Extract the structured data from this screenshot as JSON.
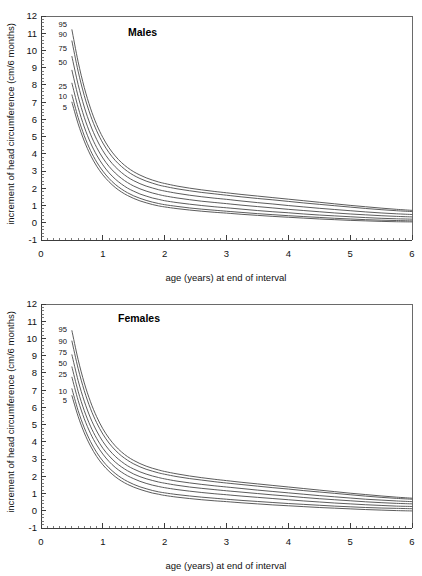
{
  "figure": {
    "background_color": "#ffffff",
    "curve_color": "#4a4a4a",
    "axis_color": "#3c3c3c"
  },
  "panels": [
    {
      "id": "males",
      "title": "Males"
    },
    {
      "id": "females",
      "title": "Females"
    }
  ],
  "axes": {
    "x_title": "age (years) at end of interval",
    "y_title": "increment of head circumference (cm/6 months)",
    "x_ticks": [
      "0",
      "1",
      "2",
      "3",
      "4",
      "5",
      "6"
    ],
    "y_ticks": [
      "-1",
      "0",
      "1",
      "2",
      "3",
      "4",
      "5",
      "6",
      "7",
      "8",
      "9",
      "10",
      "11",
      "12"
    ]
  },
  "percentile_labels": [
    "95",
    "90",
    "75",
    "50",
    "25",
    "10",
    "5"
  ],
  "chart_data": [
    {
      "type": "line",
      "title": "Males",
      "xlabel": "age (years) at end of interval",
      "ylabel": "increment of head circumference (cm/6 months)",
      "xlim": [
        0,
        6
      ],
      "ylim": [
        -1,
        12
      ],
      "xticks": [
        0,
        1,
        2,
        3,
        4,
        5,
        6
      ],
      "yticks": [
        -1,
        0,
        1,
        2,
        3,
        4,
        5,
        6,
        7,
        8,
        9,
        10,
        11,
        12
      ],
      "x_minor_tick_interval": 0.1,
      "y_minor_tick_interval": 0.2,
      "grid": false,
      "legend": "inline-labels-left",
      "x": [
        0.5,
        0.6,
        0.7,
        0.8,
        0.9,
        1.0,
        1.1,
        1.2,
        1.3,
        1.4,
        1.5,
        1.6,
        1.7,
        1.8,
        1.9,
        2.0,
        2.2,
        2.4,
        2.6,
        2.8,
        3.0,
        3.25,
        3.5,
        3.75,
        4.0,
        4.25,
        4.5,
        4.75,
        5.0,
        5.25,
        5.5,
        5.75,
        6.0
      ],
      "series": [
        {
          "name": "95",
          "values": [
            11.2,
            9.35,
            7.85,
            6.65,
            5.7,
            4.95,
            4.35,
            3.88,
            3.5,
            3.2,
            2.96,
            2.77,
            2.61,
            2.48,
            2.37,
            2.28,
            2.13,
            2.01,
            1.91,
            1.82,
            1.74,
            1.64,
            1.55,
            1.46,
            1.37,
            1.28,
            1.19,
            1.1,
            1.01,
            0.93,
            0.85,
            0.78,
            0.72
          ]
        },
        {
          "name": "90",
          "values": [
            10.55,
            8.8,
            7.38,
            6.24,
            5.34,
            4.63,
            4.07,
            3.62,
            3.27,
            2.98,
            2.75,
            2.57,
            2.42,
            2.3,
            2.19,
            2.11,
            1.97,
            1.86,
            1.76,
            1.68,
            1.6,
            1.5,
            1.41,
            1.33,
            1.24,
            1.15,
            1.07,
            0.99,
            0.91,
            0.83,
            0.76,
            0.7,
            0.65
          ]
        },
        {
          "name": "75",
          "values": [
            9.65,
            8.03,
            6.72,
            5.67,
            4.84,
            4.18,
            3.66,
            3.25,
            2.92,
            2.65,
            2.44,
            2.27,
            2.13,
            2.02,
            1.92,
            1.84,
            1.71,
            1.6,
            1.51,
            1.43,
            1.36,
            1.26,
            1.17,
            1.09,
            1.0,
            0.92,
            0.84,
            0.77,
            0.7,
            0.63,
            0.57,
            0.52,
            0.48
          ]
        },
        {
          "name": "50",
          "values": [
            8.85,
            7.34,
            6.12,
            5.14,
            4.37,
            3.76,
            3.27,
            2.89,
            2.58,
            2.33,
            2.13,
            1.97,
            1.84,
            1.73,
            1.64,
            1.56,
            1.44,
            1.34,
            1.25,
            1.18,
            1.11,
            1.02,
            0.94,
            0.86,
            0.78,
            0.71,
            0.64,
            0.57,
            0.51,
            0.46,
            0.41,
            0.37,
            0.34
          ]
        },
        {
          "name": "25",
          "values": [
            8.1,
            6.7,
            5.56,
            4.65,
            3.93,
            3.36,
            2.9,
            2.54,
            2.25,
            2.01,
            1.83,
            1.67,
            1.55,
            1.44,
            1.36,
            1.28,
            1.17,
            1.08,
            1.0,
            0.93,
            0.87,
            0.79,
            0.71,
            0.64,
            0.58,
            0.51,
            0.45,
            0.4,
            0.35,
            0.3,
            0.26,
            0.23,
            0.21
          ]
        },
        {
          "name": "10",
          "values": [
            7.42,
            6.11,
            5.05,
            4.2,
            3.53,
            3.0,
            2.57,
            2.23,
            1.96,
            1.74,
            1.56,
            1.42,
            1.3,
            1.2,
            1.12,
            1.05,
            0.95,
            0.86,
            0.79,
            0.73,
            0.67,
            0.6,
            0.53,
            0.47,
            0.41,
            0.36,
            0.31,
            0.26,
            0.22,
            0.18,
            0.15,
            0.13,
            0.11
          ]
        },
        {
          "name": "5",
          "values": [
            7.0,
            5.75,
            4.74,
            3.93,
            3.29,
            2.78,
            2.38,
            2.05,
            1.79,
            1.58,
            1.41,
            1.27,
            1.16,
            1.06,
            0.98,
            0.92,
            0.82,
            0.74,
            0.67,
            0.61,
            0.56,
            0.49,
            0.43,
            0.37,
            0.32,
            0.27,
            0.22,
            0.18,
            0.14,
            0.11,
            0.08,
            0.06,
            0.05
          ]
        }
      ]
    },
    {
      "type": "line",
      "title": "Females",
      "xlabel": "age (years) at end of interval",
      "ylabel": "increment of head circumference (cm/6 months)",
      "xlim": [
        0,
        6
      ],
      "ylim": [
        -1,
        12
      ],
      "xticks": [
        0,
        1,
        2,
        3,
        4,
        5,
        6
      ],
      "yticks": [
        -1,
        0,
        1,
        2,
        3,
        4,
        5,
        6,
        7,
        8,
        9,
        10,
        11,
        12
      ],
      "x_minor_tick_interval": 0.1,
      "y_minor_tick_interval": 0.2,
      "grid": false,
      "legend": "inline-labels-left",
      "x": [
        0.5,
        0.6,
        0.7,
        0.8,
        0.9,
        1.0,
        1.1,
        1.2,
        1.3,
        1.4,
        1.5,
        1.6,
        1.7,
        1.8,
        1.9,
        2.0,
        2.2,
        2.4,
        2.6,
        2.8,
        3.0,
        3.25,
        3.5,
        3.75,
        4.0,
        4.25,
        4.5,
        4.75,
        5.0,
        5.25,
        5.5,
        5.75,
        6.0
      ],
      "series": [
        {
          "name": "95",
          "values": [
            10.45,
            8.78,
            7.42,
            6.33,
            5.46,
            4.76,
            4.21,
            3.77,
            3.42,
            3.14,
            2.92,
            2.74,
            2.59,
            2.47,
            2.37,
            2.28,
            2.14,
            2.02,
            1.92,
            1.83,
            1.75,
            1.65,
            1.56,
            1.47,
            1.38,
            1.29,
            1.2,
            1.11,
            1.02,
            0.94,
            0.86,
            0.79,
            0.73
          ]
        },
        {
          "name": "90",
          "values": [
            9.85,
            8.26,
            6.97,
            5.93,
            5.11,
            4.45,
            3.93,
            3.52,
            3.19,
            2.93,
            2.72,
            2.55,
            2.41,
            2.3,
            2.2,
            2.12,
            1.98,
            1.87,
            1.78,
            1.69,
            1.61,
            1.52,
            1.43,
            1.34,
            1.26,
            1.17,
            1.09,
            1.01,
            0.93,
            0.85,
            0.78,
            0.72,
            0.67
          ]
        },
        {
          "name": "75",
          "values": [
            9.05,
            7.56,
            6.36,
            5.39,
            4.63,
            4.02,
            3.54,
            3.16,
            2.86,
            2.61,
            2.42,
            2.26,
            2.13,
            2.02,
            1.93,
            1.85,
            1.72,
            1.62,
            1.53,
            1.45,
            1.38,
            1.29,
            1.2,
            1.12,
            1.04,
            0.96,
            0.88,
            0.81,
            0.74,
            0.67,
            0.62,
            0.57,
            0.53
          ]
        },
        {
          "name": "50",
          "values": [
            8.35,
            6.94,
            5.81,
            4.91,
            4.2,
            3.63,
            3.19,
            2.83,
            2.55,
            2.32,
            2.13,
            1.98,
            1.86,
            1.76,
            1.67,
            1.6,
            1.48,
            1.38,
            1.3,
            1.23,
            1.16,
            1.08,
            1.0,
            0.92,
            0.85,
            0.77,
            0.7,
            0.64,
            0.58,
            0.52,
            0.47,
            0.43,
            0.4
          ]
        },
        {
          "name": "25",
          "values": [
            7.75,
            6.41,
            5.34,
            4.49,
            3.82,
            3.29,
            2.86,
            2.52,
            2.25,
            2.03,
            1.86,
            1.71,
            1.59,
            1.49,
            1.41,
            1.34,
            1.23,
            1.14,
            1.06,
            0.99,
            0.93,
            0.85,
            0.78,
            0.71,
            0.64,
            0.57,
            0.51,
            0.45,
            0.4,
            0.35,
            0.31,
            0.27,
            0.25
          ]
        },
        {
          "name": "10",
          "values": [
            7.08,
            5.82,
            4.82,
            4.02,
            3.39,
            2.89,
            2.49,
            2.17,
            1.91,
            1.7,
            1.53,
            1.39,
            1.28,
            1.18,
            1.1,
            1.04,
            0.94,
            0.86,
            0.79,
            0.73,
            0.67,
            0.6,
            0.54,
            0.48,
            0.42,
            0.37,
            0.32,
            0.27,
            0.23,
            0.19,
            0.16,
            0.14,
            0.12
          ]
        },
        {
          "name": "5",
          "values": [
            6.68,
            5.48,
            4.52,
            3.76,
            3.15,
            2.67,
            2.29,
            1.98,
            1.73,
            1.53,
            1.37,
            1.24,
            1.13,
            1.03,
            0.96,
            0.89,
            0.79,
            0.71,
            0.64,
            0.58,
            0.53,
            0.46,
            0.4,
            0.34,
            0.29,
            0.24,
            0.19,
            0.15,
            0.11,
            0.07,
            0.04,
            0.01,
            -0.01
          ]
        }
      ]
    }
  ],
  "percentile_label_positions": {
    "males": {
      "95": 11.55,
      "90": 10.95,
      "75": 10.15,
      "50": 9.35,
      "25": 7.95,
      "10": 7.35,
      "5": 6.7
    },
    "females": {
      "95": 10.55,
      "90": 9.85,
      "75": 9.2,
      "50": 8.55,
      "25": 7.95,
      "10": 6.95,
      "5": 6.4
    }
  }
}
